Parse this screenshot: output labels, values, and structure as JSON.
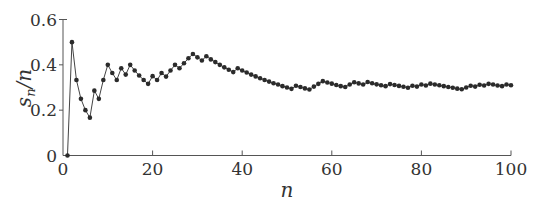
{
  "chart_data": {
    "type": "line",
    "title": "",
    "xlabel": "n",
    "ylabel": "s_n/n",
    "ylabel_parts": {
      "main": "s",
      "sub": "n",
      "rest": "/n"
    },
    "xlim": [
      0,
      100
    ],
    "ylim": [
      0,
      0.6
    ],
    "x_ticks": [
      0,
      20,
      40,
      60,
      80,
      100
    ],
    "x_tick_labels": [
      "0",
      "20",
      "40",
      "60",
      "80",
      "100"
    ],
    "y_ticks": [
      0,
      0.2,
      0.4,
      0.6
    ],
    "y_tick_labels": [
      "0",
      "0.2",
      "0.4",
      "0.6"
    ],
    "grid": false,
    "legend": null,
    "markers": true,
    "series": [
      {
        "name": "s_n/n",
        "x": [
          1,
          2,
          3,
          4,
          5,
          6,
          7,
          8,
          9,
          10,
          11,
          12,
          13,
          14,
          15,
          16,
          17,
          18,
          19,
          20,
          21,
          22,
          23,
          24,
          25,
          26,
          27,
          28,
          29,
          30,
          31,
          32,
          33,
          34,
          35,
          36,
          37,
          38,
          39,
          40,
          41,
          42,
          43,
          44,
          45,
          46,
          47,
          48,
          49,
          50,
          51,
          52,
          53,
          54,
          55,
          56,
          57,
          58,
          59,
          60,
          61,
          62,
          63,
          64,
          65,
          66,
          67,
          68,
          69,
          70,
          71,
          72,
          73,
          74,
          75,
          76,
          77,
          78,
          79,
          80,
          81,
          82,
          83,
          84,
          85,
          86,
          87,
          88,
          89,
          90,
          91,
          92,
          93,
          94,
          95,
          96,
          97,
          98,
          99,
          100
        ],
        "values": [
          0.0,
          0.5,
          0.333,
          0.25,
          0.2,
          0.167,
          0.286,
          0.25,
          0.333,
          0.4,
          0.364,
          0.333,
          0.385,
          0.357,
          0.4,
          0.375,
          0.353,
          0.333,
          0.316,
          0.35,
          0.333,
          0.364,
          0.348,
          0.375,
          0.4,
          0.385,
          0.407,
          0.429,
          0.448,
          0.433,
          0.419,
          0.438,
          0.424,
          0.412,
          0.4,
          0.389,
          0.378,
          0.368,
          0.385,
          0.375,
          0.366,
          0.357,
          0.349,
          0.341,
          0.333,
          0.326,
          0.319,
          0.313,
          0.306,
          0.3,
          0.294,
          0.308,
          0.302,
          0.296,
          0.291,
          0.304,
          0.316,
          0.328,
          0.322,
          0.317,
          0.311,
          0.306,
          0.302,
          0.313,
          0.323,
          0.318,
          0.313,
          0.324,
          0.319,
          0.314,
          0.31,
          0.306,
          0.315,
          0.311,
          0.307,
          0.303,
          0.299,
          0.308,
          0.304,
          0.313,
          0.309,
          0.317,
          0.313,
          0.31,
          0.306,
          0.302,
          0.299,
          0.295,
          0.292,
          0.3,
          0.308,
          0.304,
          0.312,
          0.309,
          0.316,
          0.313,
          0.309,
          0.306,
          0.313,
          0.31
        ]
      }
    ]
  },
  "layout": {
    "plot_left": 63,
    "plot_right": 511,
    "plot_top": 19.5,
    "plot_bottom": 155.5
  }
}
